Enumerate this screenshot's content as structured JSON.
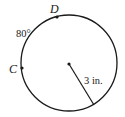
{
  "diagram": {
    "type": "circle",
    "circle": {
      "cx": 69,
      "cy": 63,
      "r": 48,
      "stroke": "#1a1a1a"
    },
    "center_point": {
      "x": 69,
      "y": 64
    },
    "points": [
      {
        "name": "D",
        "x": 57,
        "y": 17,
        "label_x": 50,
        "label_y": 13
      },
      {
        "name": "C",
        "x": 22,
        "y": 68,
        "label_x": 9,
        "label_y": 73
      }
    ],
    "arc_label": {
      "text": "80°",
      "x": 16,
      "y": 37
    },
    "radius": {
      "x1": 69,
      "y1": 64,
      "x2": 94,
      "y2": 105,
      "label": "3 in.",
      "label_x": 84,
      "label_y": 84
    }
  }
}
